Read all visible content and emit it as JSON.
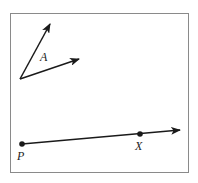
{
  "diagram": {
    "labels": {
      "angle": "A",
      "point_p": "P",
      "point_x": "X"
    },
    "colors": {
      "stroke": "#1a1a1a",
      "frame": "#8a8a8a",
      "background": "#ffffff"
    }
  }
}
